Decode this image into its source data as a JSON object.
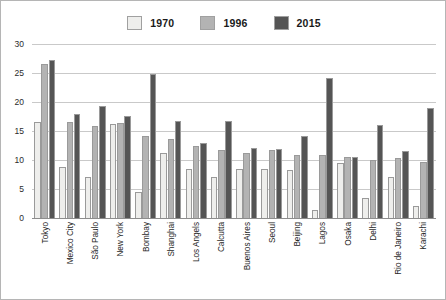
{
  "chart_data": {
    "type": "bar",
    "title": "",
    "subtitle": "",
    "xlabel": "",
    "ylabel": "",
    "ylim": [
      0,
      30
    ],
    "ytick_step": 5,
    "yticks": [
      "0",
      "5",
      "10",
      "15",
      "20",
      "25",
      "30"
    ],
    "grid": true,
    "legend_position": "top-center",
    "categories": [
      "Tokyo",
      "Mexico City",
      "São Paulo",
      "New York",
      "Bombay",
      "Shanghai",
      "Los Angels",
      "Calcutta",
      "Buenos Aires",
      "Seoul",
      "Beijing",
      "Lagos",
      "Osaka",
      "Delhi",
      "Rio de Janeiro",
      "Karachi"
    ],
    "series": [
      {
        "name": "1970",
        "color": "#eeeeec",
        "values": [
          16.5,
          8.8,
          7.0,
          16.2,
          4.4,
          11.2,
          8.4,
          7.1,
          8.4,
          8.4,
          8.3,
          1.4,
          9.4,
          3.5,
          7.0,
          2.0
        ]
      },
      {
        "name": "1996",
        "color": "#b3b3b3",
        "values": [
          26.6,
          16.5,
          15.8,
          16.3,
          14.2,
          13.7,
          12.4,
          11.7,
          11.2,
          11.8,
          10.9,
          10.9,
          10.6,
          10.0,
          10.3,
          9.6
        ]
      },
      {
        "name": "2015",
        "color": "#555555",
        "values": [
          27.2,
          18.0,
          19.3,
          17.6,
          24.8,
          16.7,
          13.0,
          16.7,
          12.0,
          11.9,
          14.2,
          24.1,
          10.6,
          16.0,
          11.6,
          19.0
        ]
      }
    ]
  },
  "legend": {
    "entries": [
      {
        "label": "1970",
        "color": "#eeeeec"
      },
      {
        "label": "1996",
        "color": "#b3b3b3"
      },
      {
        "label": "2015",
        "color": "#555555"
      }
    ]
  },
  "colors": {
    "series_1970": "#eeeeec",
    "series_1996": "#b3b3b3",
    "series_2015": "#555555",
    "gridline": "#c9c9c9",
    "axis": "#8d8d8d",
    "frame": "#b5b5b5",
    "text": "#1f1f1f"
  }
}
